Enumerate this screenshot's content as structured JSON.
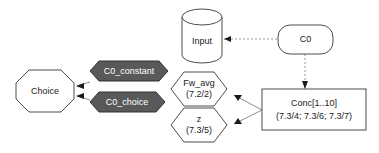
{
  "diagram": {
    "type": "node-link-diagram",
    "background_color": "#ffffff",
    "nodes": {
      "choice": {
        "label": "Choice",
        "shape": "octagon",
        "fill": "#ffffff",
        "stroke": "#4d4d4d"
      },
      "c0_constant": {
        "label": "C0_constant",
        "shape": "hexagon",
        "fill": "#595959",
        "text_color": "#ffffff"
      },
      "c0_choice": {
        "label": "C0_choice",
        "shape": "hexagon",
        "fill": "#595959",
        "text_color": "#ffffff"
      },
      "input": {
        "label": "Input",
        "shape": "cylinder",
        "fill": "#ffffff",
        "stroke": "#8c8c8c"
      },
      "c0": {
        "label": "C0",
        "shape": "rounded-rectangle",
        "fill": "#ffffff",
        "stroke": "#4d4d4d"
      },
      "fw_avg": {
        "label_line1": "Fw_avg",
        "label_line2": "(7.2/2)",
        "shape": "hexagon",
        "fill": "#ffffff",
        "stroke": "#8c8c8c"
      },
      "z": {
        "label_line1": "z",
        "label_line2": "(7.3/5)",
        "shape": "hexagon",
        "fill": "#ffffff",
        "stroke": "#8c8c8c"
      },
      "conc": {
        "label_line1": "Conc[1..10]",
        "label_line2": "(7.3/4; 7.3/6; 7.3/7)",
        "shape": "rectangle",
        "fill": "#ffffff",
        "stroke": "#4d4d4d"
      }
    },
    "edges": [
      {
        "name": "c0-to-input",
        "from": "c0",
        "to": "input",
        "style": "dashed",
        "arrow": "left"
      },
      {
        "name": "c0-to-conc",
        "from": "c0",
        "to": "conc",
        "style": "dashed",
        "arrow": "down"
      },
      {
        "name": "conc-to-fw-avg",
        "from": "conc",
        "to": "fw_avg",
        "style": "solid",
        "arrow": "left"
      },
      {
        "name": "conc-to-z",
        "from": "conc",
        "to": "z",
        "style": "solid",
        "arrow": "left"
      },
      {
        "name": "c0-constant-to-choice",
        "from": "c0_constant",
        "to": "choice",
        "style": "solid",
        "arrow": "left"
      },
      {
        "name": "c0-choice-to-choice",
        "from": "c0_choice",
        "to": "choice",
        "style": "solid",
        "arrow": "left"
      }
    ]
  }
}
